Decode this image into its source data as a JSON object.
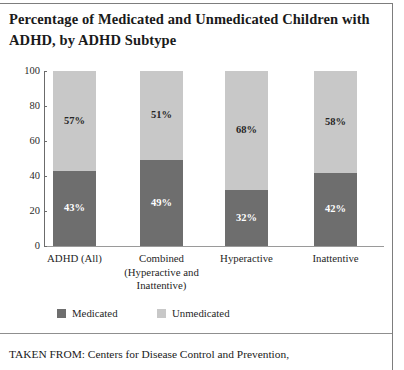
{
  "title": "Percentage of Medicated and Unmedicated Children with ADHD, by ADHD Subtype",
  "footer": "TAKEN FROM: Centers for Disease Control and Prevention,",
  "legend": {
    "items": [
      {
        "label": "Medicated",
        "color": "#6e6e6e"
      },
      {
        "label": "Unmedicated",
        "color": "#c8c8c8"
      }
    ]
  },
  "colors": {
    "medicated": "#6e6e6e",
    "unmedicated": "#c8c8c8",
    "axis": "#6b6b6b",
    "frame": "#7d7d7d"
  },
  "chart_data": {
    "type": "bar",
    "subtype": "stacked-bar-100",
    "title": "Percentage of Medicated and Unmedicated Children with ADHD, by ADHD Subtype",
    "xlabel": "",
    "ylabel": "",
    "ylim": [
      0,
      100
    ],
    "yticks": [
      0,
      20,
      40,
      60,
      80,
      100
    ],
    "ytick_labels": [
      "0",
      "20",
      "40",
      "60",
      "80",
      "100"
    ],
    "grid": false,
    "legend_position": "bottom",
    "categories": [
      "ADHD (All)",
      "Combined (Hyperactive and Inattentive)",
      "Hyperactive",
      "Inattentive"
    ],
    "category_label_lines": [
      [
        "ADHD (All)"
      ],
      [
        "Combined",
        "(Hyperactive and",
        "Inattentive)"
      ],
      [
        "Hyperactive"
      ],
      [
        "Inattentive"
      ]
    ],
    "series": [
      {
        "name": "Medicated",
        "color": "#6e6e6e",
        "values": [
          43,
          49,
          32,
          42
        ],
        "data_labels": [
          "43%",
          "49%",
          "32%",
          "42%"
        ]
      },
      {
        "name": "Unmedicated",
        "color": "#c8c8c8",
        "values": [
          57,
          51,
          68,
          58
        ],
        "data_labels": [
          "57%",
          "51%",
          "68%",
          "42%"
        ]
      }
    ],
    "unmedicated_labels": [
      "57%",
      "51%",
      "68%",
      "58%"
    ]
  }
}
